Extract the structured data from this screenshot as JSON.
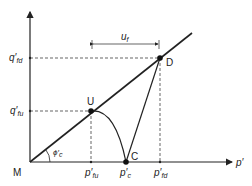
{
  "diagram": {
    "axes": {
      "x_label": "p′",
      "origin_label": "M"
    },
    "points": {
      "U": {
        "label": "U"
      },
      "C": {
        "label": "C"
      },
      "D": {
        "label": "D"
      }
    },
    "y_ticks": [
      {
        "main": "q′",
        "sub": "fd"
      },
      {
        "main": "q′",
        "sub": "fu"
      }
    ],
    "x_ticks": [
      {
        "main": "p′",
        "sub": "fu"
      },
      {
        "main": "p′",
        "sub": "c"
      },
      {
        "main": "p′",
        "sub": "fd"
      }
    ],
    "angle_label": {
      "main": "ϕ′",
      "sub": "c"
    },
    "dimension": {
      "main": "u",
      "sub": "f"
    },
    "colors": {
      "line": "#222222",
      "background": "#ffffff"
    }
  }
}
